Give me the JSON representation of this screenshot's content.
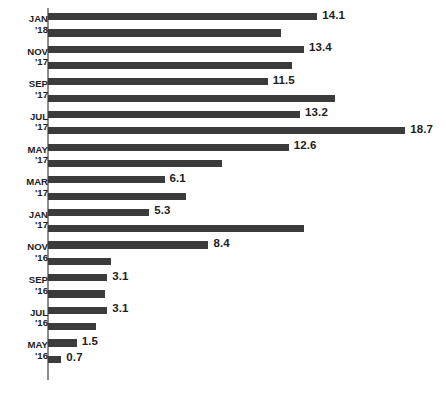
{
  "chart_data": {
    "type": "bar",
    "orientation": "horizontal",
    "title": "",
    "subtitle": "",
    "xlabel": "",
    "ylabel": "",
    "grid": false,
    "legend": null,
    "axis_line": "left-vertical-only",
    "bar_color": "#3b3b3b",
    "axis_color": "#8e8e8e",
    "label_color": "#1d1d1d",
    "xlim": [
      0,
      20.8
    ],
    "value_label_precision": 1,
    "note": "Values shown only on alternating (odd-index) bars; category tick labels shown only on alternating month pairs.",
    "categories": [
      "FEB '18",
      "JAN '18",
      "DEC '17",
      "NOV '17",
      "OCT '17",
      "SEP '17",
      "AUG '17",
      "JUL '17",
      "JUN '17",
      "MAY '17",
      "APR '17",
      "MAR '17",
      "FEB '17",
      "JAN '17",
      "DEC '16",
      "NOV '16",
      "OCT '16",
      "SEP '16",
      "AUG '16",
      "JUL '16",
      "JUN '16",
      "MAY '16"
    ],
    "values": [
      14.1,
      12.2,
      13.4,
      12.8,
      11.5,
      15.0,
      13.2,
      18.7,
      12.6,
      9.1,
      6.1,
      7.2,
      5.3,
      13.4,
      8.4,
      3.3,
      3.1,
      3.0,
      3.1,
      2.5,
      1.5,
      0.7
    ],
    "value_labels": [
      "14.1",
      "",
      "13.4",
      "",
      "11.5",
      "",
      "13.2",
      "18.7",
      "12.6",
      "",
      "6.1",
      "",
      "5.3",
      "",
      "8.4",
      "",
      "3.1",
      "",
      "3.1",
      "",
      "1.5",
      "0.7"
    ],
    "tick_labels": [
      {
        "month": "JAN",
        "year": "'18",
        "between_bars": [
          0,
          1
        ]
      },
      {
        "month": "NOV",
        "year": "'17",
        "between_bars": [
          2,
          3
        ]
      },
      {
        "month": "SEP",
        "year": "'17",
        "between_bars": [
          4,
          5
        ]
      },
      {
        "month": "JUL",
        "year": "'17",
        "between_bars": [
          6,
          7
        ]
      },
      {
        "month": "MAY",
        "year": "'17",
        "between_bars": [
          8,
          9
        ]
      },
      {
        "month": "MAR",
        "year": "'17",
        "between_bars": [
          10,
          11
        ]
      },
      {
        "month": "JAN",
        "year": "'17",
        "between_bars": [
          12,
          13
        ]
      },
      {
        "month": "NOV",
        "year": "'16",
        "between_bars": [
          14,
          15
        ]
      },
      {
        "month": "SEP",
        "year": "'16",
        "between_bars": [
          16,
          17
        ]
      },
      {
        "month": "JUL",
        "year": "'16",
        "between_bars": [
          18,
          19
        ]
      },
      {
        "month": "MAY",
        "year": "'16",
        "between_bars": [
          20,
          21
        ]
      }
    ]
  }
}
